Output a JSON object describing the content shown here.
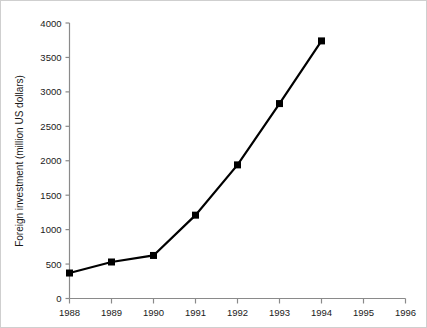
{
  "chart_data": {
    "type": "line",
    "title": "",
    "xlabel": "",
    "ylabel": "Foreign investment (million US dollars)",
    "x": [
      1988,
      1989,
      1990,
      1991,
      1992,
      1993,
      1994
    ],
    "values": [
      370,
      530,
      625,
      1210,
      1940,
      2830,
      3740
    ],
    "series": [
      {
        "name": "Foreign investment",
        "values": [
          370,
          530,
          625,
          1210,
          1940,
          2830,
          3740
        ],
        "color": "#000000",
        "marker": "filled-square"
      }
    ],
    "xtick_labels": [
      "1988",
      "1989",
      "1990",
      "1991",
      "1992",
      "1993",
      "1994",
      "1995",
      "1996"
    ],
    "xtick_values": [
      1988,
      1989,
      1990,
      1991,
      1992,
      1993,
      1994,
      1995,
      1996
    ],
    "ytick_labels": [
      "0",
      "500",
      "1000",
      "1500",
      "2000",
      "2500",
      "3000",
      "3500",
      "4000"
    ],
    "ytick_values": [
      0,
      500,
      1000,
      1500,
      2000,
      2500,
      3000,
      3500,
      4000
    ],
    "xlim": [
      1988,
      1996
    ],
    "ylim": [
      0,
      4000
    ],
    "grid": false,
    "legend": "none",
    "annotations": []
  },
  "colors": {
    "background": "#ffffff",
    "axis": "#8a8a8a",
    "series": "#000000",
    "text": "#1a1a1a",
    "border": "#cfcfcf"
  }
}
